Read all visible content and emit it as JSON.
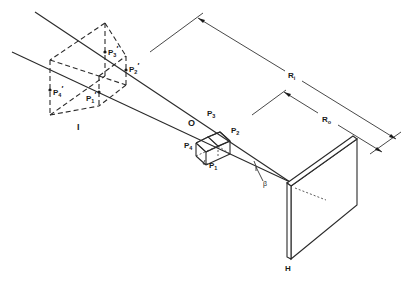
{
  "figure": {
    "labels": {
      "image": "I",
      "object": "O",
      "hologram": "H",
      "angle": "β",
      "image_distance": {
        "main": "R",
        "sub": "i"
      },
      "object_distance": {
        "main": "R",
        "sub": "o"
      }
    },
    "object_points": [
      {
        "main": "P",
        "sub": "1"
      },
      {
        "main": "P",
        "sub": "2"
      },
      {
        "main": "P",
        "sub": "3"
      },
      {
        "main": "P",
        "sub": "4"
      }
    ],
    "image_points": [
      {
        "main": "P",
        "sub": "1",
        "prime": "′"
      },
      {
        "main": "P",
        "sub": "2",
        "prime": "′"
      },
      {
        "main": "P",
        "sub": "3",
        "prime": "′"
      },
      {
        "main": "P",
        "sub": "4",
        "prime": "′"
      }
    ],
    "colors": {
      "line": "#2a2a2a",
      "background": "#ffffff"
    }
  }
}
